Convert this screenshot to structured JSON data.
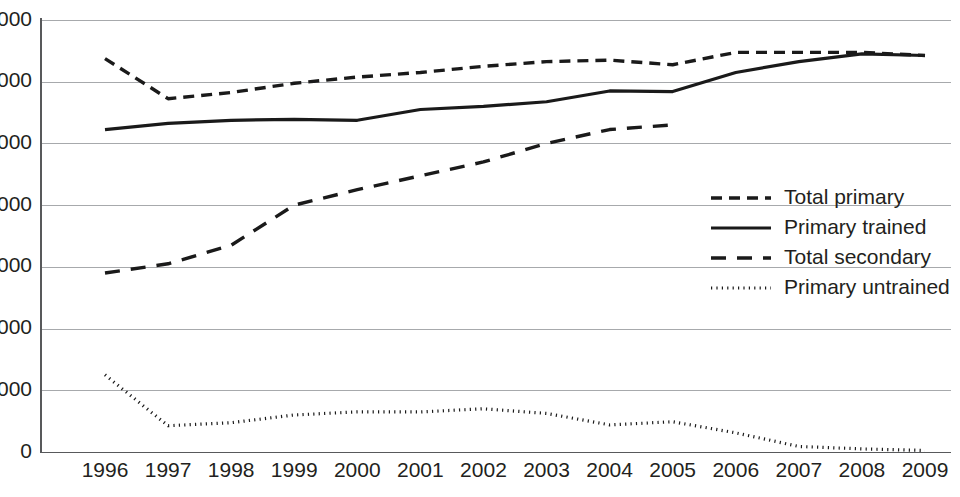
{
  "chart_data": {
    "type": "line",
    "title": "",
    "subtitle": "",
    "xlabel": "",
    "ylabel": "",
    "categories": [
      "1996",
      "1997",
      "1998",
      "1999",
      "2000",
      "2001",
      "2002",
      "2003",
      "2004",
      "2005",
      "2006",
      "2007",
      "2008",
      "2009"
    ],
    "x": [
      1996,
      1997,
      1998,
      1999,
      2000,
      2001,
      2002,
      2003,
      2004,
      2005,
      2006,
      2007,
      2008,
      2009
    ],
    "ylim": [
      0,
      14000
    ],
    "xlim": [
      1996,
      2009
    ],
    "yticks": [
      0,
      2000,
      4000,
      6000,
      8000,
      10000,
      12000,
      14000
    ],
    "ytick_labels": [
      "0",
      "2 000",
      "4 000",
      "6 000",
      "8 000",
      "10 000",
      "12 000",
      "14 000"
    ],
    "grid": true,
    "legend_position": "center-right",
    "series": [
      {
        "name": "Total primary",
        "style": "dashed-short",
        "color": "#1a1a1a",
        "values": [
          12750,
          11450,
          11650,
          11950,
          12150,
          12300,
          12500,
          12650,
          12700,
          12550,
          12950,
          12950,
          12950,
          12850
        ]
      },
      {
        "name": "Primary trained",
        "style": "solid",
        "color": "#1a1a1a",
        "values": [
          10450,
          10650,
          10750,
          10780,
          10750,
          11100,
          11200,
          11350,
          11700,
          11680,
          12300,
          12650,
          12900,
          12850
        ]
      },
      {
        "name": "Total secondary",
        "style": "dashed-long",
        "color": "#1a1a1a",
        "values": [
          5800,
          6100,
          6700,
          8000,
          8500,
          8950,
          9400,
          10000,
          10450,
          10600,
          null,
          null,
          null,
          null
        ]
      },
      {
        "name": "Primary untrained",
        "style": "dotted",
        "color": "#1a1a1a",
        "values": [
          2500,
          850,
          950,
          1200,
          1300,
          1300,
          1400,
          1250,
          880,
          980,
          620,
          180,
          100,
          50
        ]
      }
    ]
  },
  "legend": {
    "entries": [
      {
        "label": "Total primary"
      },
      {
        "label": "Primary trained"
      },
      {
        "label": "Total secondary"
      },
      {
        "label": "Primary untrained"
      }
    ]
  },
  "axes": {
    "y_labels": [
      "14 000",
      "12 000",
      "10 000",
      "8 000",
      "6 000",
      "4 000",
      "2 000",
      "0"
    ],
    "x_labels": [
      "1996",
      "1997",
      "1998",
      "1999",
      "2000",
      "2001",
      "2002",
      "2003",
      "2004",
      "2005",
      "2006",
      "2007",
      "2008",
      "2009"
    ]
  }
}
